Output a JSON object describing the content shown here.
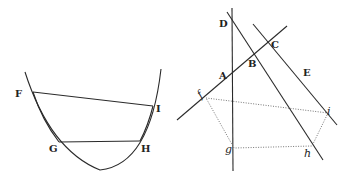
{
  "figure_left": {
    "name": "parabola-figure",
    "labels": {
      "F": "F",
      "I": "I",
      "G": "G",
      "H": "H"
    },
    "points": {
      "F": [
        33,
        92
      ],
      "I": [
        153,
        106
      ],
      "G": [
        59,
        142
      ],
      "H": [
        140,
        141
      ]
    }
  },
  "figure_right": {
    "name": "lines-figure",
    "labels": {
      "A": "A",
      "B": "B",
      "C": "C",
      "D": "D",
      "E": "E",
      "f": "f",
      "g": "g",
      "h": "h",
      "i": "i"
    }
  },
  "colors": {
    "ink": "#2a2a2a",
    "dotted": "#666666",
    "background": "#ffffff"
  }
}
